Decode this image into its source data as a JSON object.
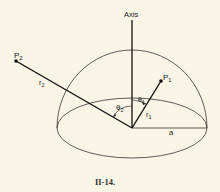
{
  "figure": {
    "caption": "II-14.",
    "labels": {
      "axis": "Axis",
      "p1": "P",
      "p1_sub": "1",
      "p2": "P",
      "p2_sub": "2",
      "r1": "r",
      "r1_sub": "1",
      "r2": "r",
      "r2_sub": "2",
      "theta1": "θ",
      "theta1_sub": "1",
      "theta2": "θ",
      "theta2_sub": "2",
      "a": "a"
    },
    "colors": {
      "background": "#f8f5e6",
      "ink": "#222222"
    }
  }
}
